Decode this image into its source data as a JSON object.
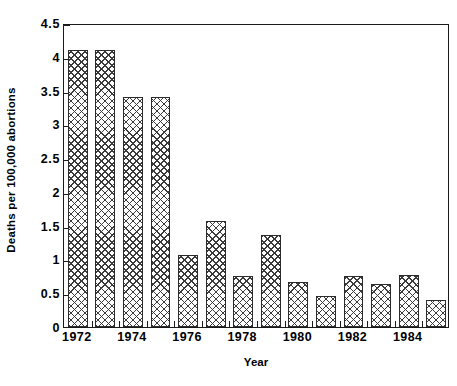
{
  "chart_data": {
    "type": "bar",
    "title": "",
    "xlabel": "Year",
    "ylabel": "Deaths per 100,000 abortions",
    "categories": [
      "1972",
      "1973",
      "1974",
      "1975",
      "1976",
      "1977",
      "1978",
      "1979",
      "1980",
      "1981",
      "1982",
      "1983",
      "1984",
      "1985"
    ],
    "values": [
      4.1,
      4.1,
      3.4,
      3.4,
      1.07,
      1.57,
      0.76,
      1.36,
      0.66,
      0.46,
      0.76,
      0.64,
      0.77,
      0.4
    ],
    "ylim": [
      0,
      4.5
    ],
    "yticks": [
      "0",
      "0.5",
      "1",
      "1.5",
      "2",
      "2.5",
      "3",
      "3.5",
      "4",
      "4.5"
    ],
    "ytick_values": [
      0,
      0.5,
      1,
      1.5,
      2,
      2.5,
      3,
      3.5,
      4,
      4.5
    ],
    "xtick_labels": [
      "1972",
      "1974",
      "1976",
      "1978",
      "1980",
      "1982",
      "1984"
    ],
    "xtick_categories": [
      "1972",
      "1974",
      "1976",
      "1978",
      "1980",
      "1982",
      "1984"
    ],
    "grid": false,
    "legend": false,
    "bar_fill": "cross-hatch",
    "bar_edge_color": "#2b2b2b",
    "axis_color": "#1a1a1a",
    "background_color": "#ffffff"
  }
}
